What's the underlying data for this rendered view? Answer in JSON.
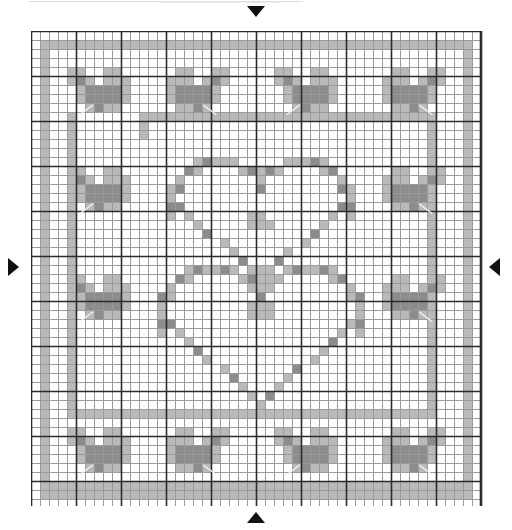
{
  "chart_data": {
    "type": "heatmap",
    "subtitle": "",
    "xlabel": "",
    "ylabel": "",
    "grid": true,
    "legend_position": "none",
    "columns": 50,
    "rows": 53,
    "cell_size_px": 9,
    "heavy_line_every": 5,
    "xlim": [
      0,
      50
    ],
    "ylim": [
      0,
      53
    ],
    "categories": [
      "empty",
      "light",
      "dark"
    ],
    "value_colors": {
      "empty": "#ffffff",
      "light": "#b9b9b9",
      "dark": "#8c8c8c"
    },
    "grid_colors": {
      "thin_line": "#9a9a9a",
      "heavy_line": "#2b2b2b",
      "background": "#ffffff"
    },
    "motifs": [
      {
        "name": "outer-frame-light",
        "kind": "border-line",
        "shade": "light"
      },
      {
        "name": "inner-frame-light",
        "kind": "border-line",
        "shade": "light"
      },
      {
        "name": "heart-upper",
        "kind": "heart-outline",
        "shade": "mixed"
      },
      {
        "name": "heart-lower",
        "kind": "heart-outline",
        "shade": "mixed"
      },
      {
        "name": "butterfly",
        "kind": "butterfly",
        "shade": "mixed",
        "count": 12
      }
    ],
    "annotations": [
      {
        "name": "center-marker-top",
        "symbol": "▼",
        "position": "top-center"
      },
      {
        "name": "center-marker-bottom",
        "symbol": "▲",
        "position": "bottom-center"
      },
      {
        "name": "center-marker-left",
        "symbol": "▶",
        "position": "left-middle"
      },
      {
        "name": "center-marker-right",
        "symbol": "◀",
        "position": "right-middle"
      }
    ],
    "butterfly_cells_light": [
      [
        0,
        0
      ],
      [
        1,
        0
      ],
      [
        4,
        0
      ],
      [
        5,
        0
      ],
      [
        0,
        1
      ],
      [
        1,
        1
      ],
      [
        2,
        1
      ],
      [
        4,
        1
      ],
      [
        5,
        1
      ],
      [
        6,
        1
      ],
      [
        1,
        2
      ],
      [
        6,
        2
      ],
      [
        1,
        3
      ],
      [
        2,
        3
      ],
      [
        5,
        3
      ],
      [
        6,
        3
      ],
      [
        2,
        4
      ],
      [
        3,
        4
      ],
      [
        4,
        4
      ],
      [
        5,
        4
      ]
    ],
    "butterfly_cells_dark": [
      [
        1,
        1
      ],
      [
        2,
        2
      ],
      [
        3,
        2
      ],
      [
        4,
        2
      ],
      [
        2,
        3
      ],
      [
        3,
        3
      ],
      [
        4,
        3
      ],
      [
        3,
        4
      ],
      [
        5,
        2
      ],
      [
        5,
        3
      ]
    ],
    "heart_upper": {
      "center_col": 25,
      "top_row": 14,
      "bottom_row": 27,
      "half_width": 9
    },
    "heart_lower": {
      "center_col": 25,
      "top_row": 26,
      "bottom_row": 41,
      "half_width": 10
    },
    "series": [
      {
        "name": "light-cells",
        "color": "#b9b9b9"
      },
      {
        "name": "dark-cells",
        "color": "#8c8c8c"
      }
    ]
  },
  "markers": {
    "top": "▼",
    "bottom": "▲",
    "left": "▶",
    "right": "◀"
  }
}
